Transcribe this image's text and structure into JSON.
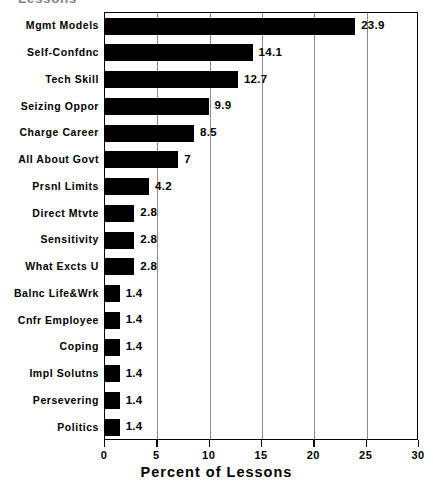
{
  "chart_data": {
    "type": "bar",
    "orientation": "horizontal",
    "title": "Lessons",
    "xlabel": "Percent of Lessons",
    "ylabel": "",
    "xlim": [
      0,
      30
    ],
    "xticks": [
      0,
      5,
      10,
      15,
      20,
      25,
      30
    ],
    "xtick_labels": [
      "0",
      "5",
      "10",
      "15",
      "20",
      "25",
      "30"
    ],
    "grid": true,
    "grid_axis": "x",
    "legend": false,
    "bar_color": "#000000",
    "background_color": "#FFFFFF",
    "axis_color": "#000000",
    "categories": [
      "Mgmt Models",
      "Self-Confdnc",
      "Tech Skill",
      "Seizing Oppor",
      "Charge Career",
      "All About Govt",
      "Prsnl Limits",
      "Direct Mtvte",
      "Sensitivity",
      "What Excts U",
      "Balnc Life&Wrk",
      "Cnfr Employee",
      "Coping",
      "Impl Solutns",
      "Persevering",
      "Politics"
    ],
    "values": [
      23.9,
      14.1,
      12.7,
      9.9,
      8.5,
      7,
      4.2,
      2.8,
      2.8,
      2.8,
      1.4,
      1.4,
      1.4,
      1.4,
      1.4,
      1.4
    ],
    "value_labels": [
      "23.9",
      "14.1",
      "12.7",
      "9.9",
      "8.5",
      "7",
      "4.2",
      "2.8",
      "2.8",
      "2.8",
      "1.4",
      "1.4",
      "1.4",
      "1.4",
      "1.4",
      "1.4"
    ]
  }
}
